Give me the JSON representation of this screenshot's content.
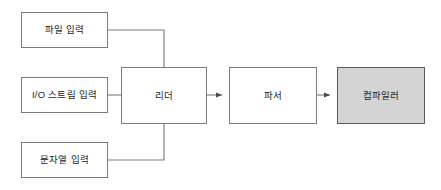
{
  "diagram": {
    "type": "flowchart",
    "orientation": "left-to-right",
    "background_color": "#ffffff",
    "default_node_fill": "#ffffff",
    "default_node_border": "#7a7a7a",
    "highlight_node_fill": "#d4d4d4",
    "highlight_node_border": "#5a5a5a",
    "connector_color": "#7a7a7a",
    "nodes": [
      {
        "id": "file-input",
        "label": "파일 입력",
        "highlighted": false,
        "x": 21,
        "y": 12,
        "width": 87,
        "height": 36
      },
      {
        "id": "io-stream-input",
        "label": "I/O 스트림 입력",
        "highlighted": false,
        "x": 21,
        "y": 77,
        "width": 87,
        "height": 36
      },
      {
        "id": "string-input",
        "label": "문자열 입력",
        "highlighted": false,
        "x": 21,
        "y": 142,
        "width": 87,
        "height": 36
      },
      {
        "id": "reader",
        "label": "리더",
        "highlighted": false,
        "x": 121,
        "y": 67,
        "width": 86,
        "height": 57
      },
      {
        "id": "parser",
        "label": "파서",
        "highlighted": false,
        "x": 229,
        "y": 67,
        "width": 88,
        "height": 57
      },
      {
        "id": "compiler",
        "label": "컴파일러",
        "highlighted": true,
        "x": 337,
        "y": 67,
        "width": 88,
        "height": 57
      }
    ],
    "edges": [
      {
        "id": "file-input-to-reader",
        "from": "file-input",
        "to": "reader",
        "arrowhead": false,
        "style": "orthogonal"
      },
      {
        "id": "io-stream-input-to-reader",
        "from": "io-stream-input",
        "to": "reader",
        "arrowhead": false,
        "style": "straight"
      },
      {
        "id": "string-input-to-reader",
        "from": "string-input",
        "to": "reader",
        "arrowhead": false,
        "style": "orthogonal"
      },
      {
        "id": "reader-to-parser",
        "from": "reader",
        "to": "parser",
        "arrowhead": true,
        "style": "straight"
      },
      {
        "id": "parser-to-compiler",
        "from": "parser",
        "to": "compiler",
        "arrowhead": true,
        "style": "straight"
      }
    ]
  }
}
